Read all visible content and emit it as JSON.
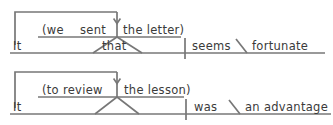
{
  "figure": {
    "ink_color": "#777777",
    "text_color": "#3a3a3a",
    "background": "#ffffff"
  },
  "diagrams": [
    {
      "id": "diagram-1",
      "sentence": "It seems fortunate that we sent the letter",
      "main_clause": {
        "subject": "It",
        "verb": "seems",
        "complement": "fortunate"
      },
      "subordinator": "that",
      "embedded_clause": {
        "subject": "(we",
        "verb": "sent",
        "object": "the letter)"
      }
    },
    {
      "id": "diagram-2",
      "sentence": "It was an advantage to review the lesson",
      "main_clause": {
        "subject": "It",
        "verb": "was",
        "complement": "an advantage"
      },
      "subordinator": "",
      "embedded_clause": {
        "subject": "(to review",
        "verb": "",
        "object": "the lesson)"
      }
    }
  ]
}
